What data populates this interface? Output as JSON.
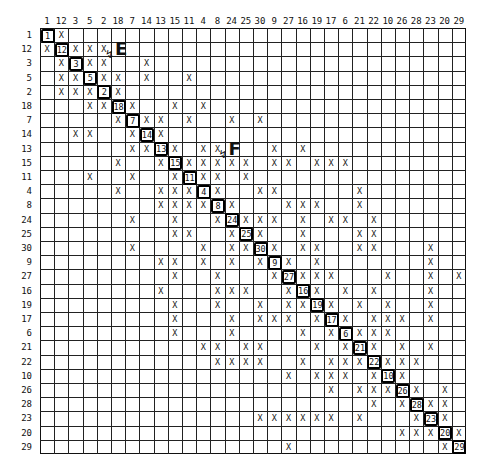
{
  "labels": [
    "1",
    "12",
    "3",
    "5",
    "2",
    "18",
    "7",
    "14",
    "13",
    "15",
    "11",
    "4",
    "8",
    "24",
    "25",
    "30",
    "9",
    "27",
    "16",
    "19",
    "17",
    "6",
    "21",
    "22",
    "10",
    "26",
    "28",
    "23",
    "20",
    "29"
  ],
  "marks": {
    "1": [
      "12"
    ],
    "12": [
      "1",
      "3",
      "5",
      "2"
    ],
    "3": [
      "12",
      "5",
      "2",
      "14"
    ],
    "5": [
      "12",
      "3",
      "2",
      "18",
      "14",
      "11"
    ],
    "2": [
      "12",
      "3",
      "5",
      "18"
    ],
    "18": [
      "5",
      "2",
      "7",
      "15",
      "4"
    ],
    "7": [
      "18",
      "14",
      "13",
      "11",
      "24",
      "30"
    ],
    "14": [
      "3",
      "5",
      "7",
      "13"
    ],
    "13": [
      "7",
      "14",
      "15",
      "4",
      "8",
      "9",
      "16"
    ],
    "15": [
      "18",
      "13",
      "11",
      "4",
      "8",
      "24",
      "25",
      "9",
      "27",
      "19",
      "17",
      "6"
    ],
    "11": [
      "5",
      "7",
      "15",
      "4",
      "8",
      "25"
    ],
    "4": [
      "18",
      "13",
      "15",
      "11",
      "8",
      "30",
      "9",
      "21"
    ],
    "8": [
      "13",
      "15",
      "11",
      "4",
      "24",
      "27",
      "16",
      "19",
      "21"
    ],
    "24": [
      "7",
      "15",
      "8",
      "25",
      "30",
      "9",
      "16",
      "17",
      "6",
      "22"
    ],
    "25": [
      "15",
      "11",
      "24",
      "30",
      "16",
      "21",
      "22"
    ],
    "30": [
      "7",
      "4",
      "24",
      "25",
      "9",
      "16",
      "19",
      "21",
      "22",
      "23"
    ],
    "9": [
      "13",
      "15",
      "4",
      "24",
      "30",
      "27",
      "19",
      "23"
    ],
    "27": [
      "15",
      "8",
      "9",
      "16",
      "19",
      "17",
      "10",
      "23",
      "29"
    ],
    "16": [
      "13",
      "8",
      "24",
      "25",
      "27",
      "19",
      "6",
      "22",
      "23"
    ],
    "19": [
      "15",
      "8",
      "30",
      "27",
      "16",
      "17",
      "21",
      "10",
      "23"
    ],
    "17": [
      "15",
      "24",
      "30",
      "9",
      "27",
      "19",
      "6",
      "22",
      "10",
      "26",
      "23"
    ],
    "6": [
      "15",
      "24",
      "16",
      "17",
      "21",
      "22",
      "10"
    ],
    "21": [
      "4",
      "8",
      "25",
      "30",
      "19",
      "6",
      "22",
      "26",
      "23"
    ],
    "22": [
      "8",
      "24",
      "25",
      "30",
      "16",
      "17",
      "6",
      "21",
      "10",
      "26",
      "28"
    ],
    "10": [
      "27",
      "19",
      "17",
      "6",
      "22",
      "26"
    ],
    "26": [
      "17",
      "21",
      "22",
      "10",
      "28",
      "20"
    ],
    "28": [
      "22",
      "26",
      "23",
      "20"
    ],
    "23": [
      "30",
      "9",
      "27",
      "16",
      "19",
      "17",
      "21",
      "28",
      "20"
    ],
    "20": [
      "26",
      "28",
      "23",
      "29"
    ],
    "29": [
      "27",
      "20"
    ]
  },
  "mark_symbol": "X",
  "annotations": [
    {
      "label": "E",
      "near_row": "12",
      "near_col": "18"
    },
    {
      "label": "F",
      "near_row": "13",
      "near_col": "24"
    }
  ]
}
